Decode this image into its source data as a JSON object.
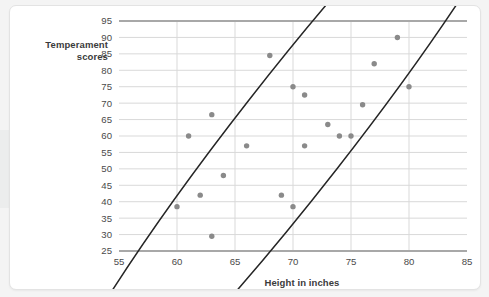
{
  "chart_data": {
    "type": "scatter",
    "title": "",
    "xlabel": "Height in inches",
    "ylabel": "Temperament scores",
    "ylabel_lines": [
      "Temperament",
      "scores"
    ],
    "xlim": [
      55,
      85
    ],
    "ylim": [
      25,
      95
    ],
    "xticks": [
      55,
      60,
      65,
      70,
      75,
      80,
      85
    ],
    "yticks": [
      25,
      30,
      35,
      40,
      45,
      50,
      55,
      60,
      65,
      70,
      75,
      80,
      85,
      90,
      95
    ],
    "grid": "horizontal-and-vertical",
    "legend": "none",
    "point_color": "#8a8a8a",
    "grid_color": "#d9d9d9",
    "axis_color": "#a8a8a8",
    "annotation_color": "#262626",
    "points": [
      {
        "x": 60,
        "y": 38.5
      },
      {
        "x": 61,
        "y": 60
      },
      {
        "x": 62,
        "y": 42
      },
      {
        "x": 63,
        "y": 66.5
      },
      {
        "x": 63,
        "y": 29.5
      },
      {
        "x": 64,
        "y": 48
      },
      {
        "x": 66,
        "y": 57
      },
      {
        "x": 68,
        "y": 84.5
      },
      {
        "x": 69,
        "y": 42
      },
      {
        "x": 70,
        "y": 75
      },
      {
        "x": 70,
        "y": 38.5
      },
      {
        "x": 71,
        "y": 72.5
      },
      {
        "x": 71,
        "y": 57
      },
      {
        "x": 73,
        "y": 63.5
      },
      {
        "x": 74,
        "y": 60
      },
      {
        "x": 75,
        "y": 60
      },
      {
        "x": 76,
        "y": 69.5
      },
      {
        "x": 77,
        "y": 82
      },
      {
        "x": 79,
        "y": 90
      },
      {
        "x": 80,
        "y": 75
      }
    ],
    "annotations": [
      {
        "kind": "ellipse",
        "label": "correlation-ellipse",
        "center_x": 70,
        "center_y": 60.5,
        "semi_major": 36,
        "semi_minor": 17,
        "rotation_deg": -52,
        "stroke": "#262626"
      }
    ]
  }
}
